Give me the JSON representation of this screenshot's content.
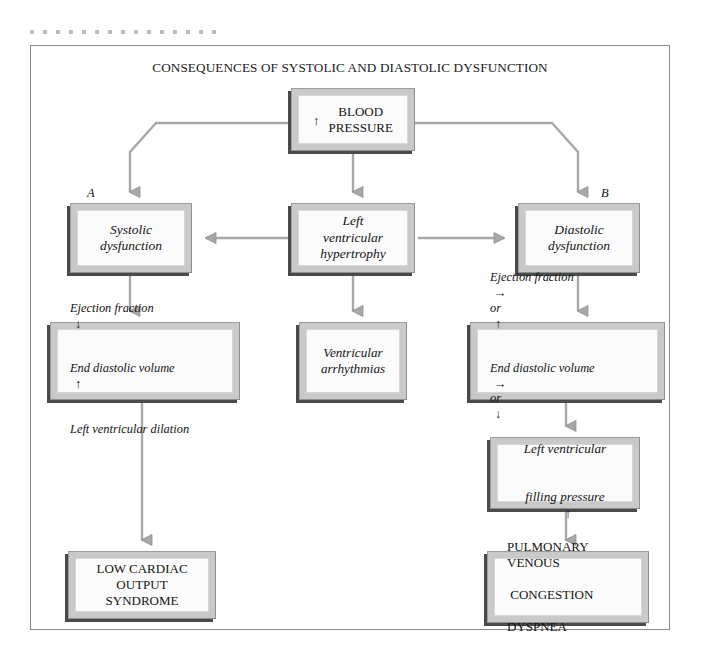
{
  "figure": {
    "title": "CONSEQUENCES OF SYSTOLIC AND DIASTOLIC DYSFUNCTION",
    "colors": {
      "frame_border": "#8a8a8a",
      "box_band": "#c9c9c9",
      "box_fill": "#fbfbfb",
      "box_shadow": "#4a4a4a",
      "connector": "#a8a8a8",
      "text": "#141414",
      "dot_rule": "#bdbdbd"
    }
  },
  "branch_labels": {
    "a": "A",
    "b": "B"
  },
  "nodes": {
    "blood_pressure": {
      "arrow": "↑",
      "line1": "BLOOD",
      "line2": "PRESSURE",
      "text": "BLOOD\nPRESSURE"
    },
    "systolic": {
      "text": "Systolic\ndysfunction"
    },
    "lvh": {
      "text": "Left\nventricular\nhypertrophy"
    },
    "diastolic": {
      "text": "Diastolic\ndysfunction"
    },
    "systolic_detail": {
      "row1_text": "Ejection fraction",
      "row1_arrow": "↓",
      "row2_text": "End diastolic volume",
      "row2_arrow": "↑",
      "row3_text": "Left ventricular dilation"
    },
    "arrhythmias": {
      "text": "Ventricular\narrhythmias"
    },
    "diastolic_detail": {
      "row1_text": "Ejection fraction",
      "row1_arrow1": "→",
      "row1_or": "or",
      "row1_arrow2": "↑",
      "row2_text": "End diastolic volume",
      "row2_arrow1": "→",
      "row2_or": "or",
      "row2_arrow2": "↓",
      "row3_text": "Left ventricular size normal"
    },
    "filling_pressure": {
      "line1": "Left ventricular",
      "line2": "filling pressure",
      "arrow": "↑"
    },
    "low_output": {
      "text": "LOW CARDIAC\nOUTPUT\nSYNDROME"
    },
    "pulmonary": {
      "line1": "PULMONARY VENOUS",
      "line2": " CONGESTION",
      "line3": "DYSPNEA"
    }
  }
}
